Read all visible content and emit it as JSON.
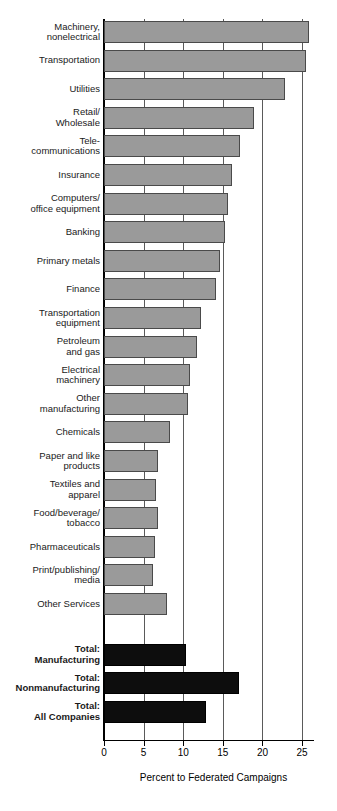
{
  "chart_data": {
    "type": "bar",
    "orientation": "horizontal",
    "title": "",
    "xlabel": "Percent to Federated Campaigns",
    "ylabel": "",
    "xlim": [
      0,
      26.5
    ],
    "xticks": [
      0,
      5,
      10,
      15,
      20,
      25
    ],
    "xtick_labels": [
      "0",
      "5",
      "10",
      "15",
      "20",
      "25"
    ],
    "grid": "vertical",
    "legend": "none",
    "series_colors": {
      "industry": "#9a9a9a",
      "total": "#0d0d0d"
    },
    "categories": [
      "Machinery,\nnonelectrical",
      "Transportation",
      "Utilities",
      "Retail/\nWholesale",
      "Tele-\ncommunications",
      "Insurance",
      "Computers/\noffice equipment",
      "Banking",
      "Primary metals",
      "Finance",
      "Transportation\nequipment",
      "Petroleum\nand gas",
      "Electrical\nmachinery",
      "Other\nmanufacturing",
      "Chemicals",
      "Paper and like\nproducts",
      "Textiles and\napparel",
      "Food/beverage/\ntobacco",
      "Pharmaceuticals",
      "Print/publishing/\nmedia",
      "Other Services",
      "Total:\nManufacturing",
      "Total:\nNonmanufacturing",
      "Total:\nAll Companies"
    ],
    "values": [
      25.9,
      25.5,
      22.9,
      18.9,
      17.1,
      16.1,
      15.7,
      15.3,
      14.7,
      14.1,
      12.2,
      11.7,
      10.9,
      10.6,
      8.3,
      6.8,
      6.6,
      6.8,
      6.4,
      6.2,
      8.0,
      10.4,
      17.0,
      12.9
    ],
    "is_total": [
      false,
      false,
      false,
      false,
      false,
      false,
      false,
      false,
      false,
      false,
      false,
      false,
      false,
      false,
      false,
      false,
      false,
      false,
      false,
      false,
      false,
      true,
      true,
      true
    ]
  }
}
